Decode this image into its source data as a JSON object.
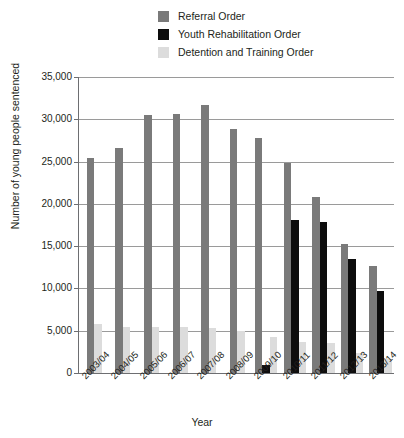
{
  "chart_data": {
    "type": "bar",
    "title": "",
    "xlabel": "Year",
    "ylabel": "Number of young people sentenced",
    "categories": [
      "2003/04",
      "2004/05",
      "2005/06",
      "2006/07",
      "2007/08",
      "2008/09",
      "2009/10",
      "2010/11",
      "2011/12",
      "2012/13",
      "2013/14"
    ],
    "series": [
      {
        "name": "Referral Order",
        "color": "#7a7a7a",
        "values": [
          25400,
          26600,
          30500,
          30600,
          31700,
          28800,
          27800,
          24800,
          20800,
          15300,
          12600
        ]
      },
      {
        "name": "Youth Rehabilitation Order",
        "color": "#0d0d0d",
        "values": [
          0,
          0,
          0,
          0,
          0,
          0,
          1000,
          18100,
          17800,
          13500,
          9700
        ]
      },
      {
        "name": "Detention and Training Order",
        "color": "#dcdcdc",
        "values": [
          5800,
          5500,
          5500,
          5400,
          5300,
          5000,
          4300,
          3700,
          3500,
          2400,
          1700
        ]
      }
    ],
    "ylim": [
      0,
      35000
    ],
    "ytick_values": [
      0,
      5000,
      10000,
      15000,
      20000,
      25000,
      30000,
      35000
    ],
    "ytick_labels": [
      "0",
      "5,000",
      "10,000",
      "15,000",
      "20,000",
      "25,000",
      "30,000",
      "35,000"
    ],
    "grid": true,
    "legend_position": "top-center"
  },
  "legend": {
    "items": [
      {
        "label": "Referral Order",
        "color": "#7a7a7a"
      },
      {
        "label": "Youth Rehabilitation Order",
        "color": "#0d0d0d"
      },
      {
        "label": "Detention and Training Order",
        "color": "#dcdcdc"
      }
    ]
  },
  "axes": {
    "x_title": "Year",
    "y_title": "Number of young people sentenced"
  }
}
